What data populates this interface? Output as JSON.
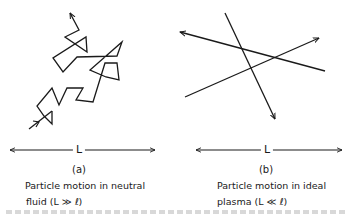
{
  "figure": {
    "panels": [
      {
        "id": "a",
        "tag": "(a)",
        "length_label": "L",
        "caption_line1": "Particle motion in neutral",
        "caption_line2": "fluid (L ≫ ℓ)",
        "illustration": "random-walk trajectory with many collisions"
      },
      {
        "id": "b",
        "tag": "(b)",
        "length_label": "L",
        "caption_line1": "Particle motion in ideal",
        "caption_line2": "plasma (L ≪ ℓ)",
        "illustration": "three straight-line trajectories crossing"
      }
    ],
    "colors": {
      "ink": "#1a1a1a",
      "background": "#ffffff"
    }
  }
}
